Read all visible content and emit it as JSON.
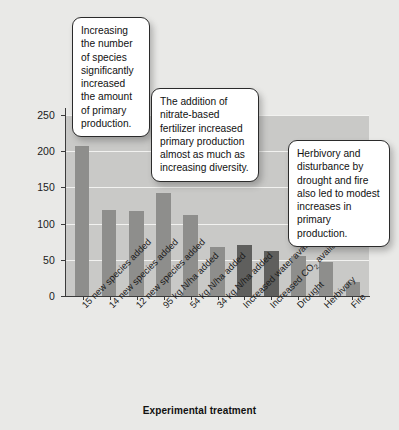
{
  "chart_data": {
    "type": "bar",
    "title": "",
    "xlabel": "Experimental treatment",
    "ylabel": "Biomass difference (g m⁻²)",
    "ylim": [
      0,
      250
    ],
    "yticks": [
      0,
      50,
      100,
      150,
      200,
      250
    ],
    "ytick_labels": [
      "0",
      "50",
      "100",
      "150",
      "200",
      "250"
    ],
    "grid": true,
    "legend": "none",
    "categories": [
      "15 new species added",
      "14 new species added",
      "12 new species added",
      "95 kg N/ha added",
      "54 kg N/ha added",
      "34 kg N/ha added",
      "Increased water availability",
      "Increased CO₂ availability",
      "Drought",
      "Herbivory",
      "Fire"
    ],
    "values": [
      207,
      119,
      117,
      142,
      112,
      68,
      70,
      62,
      55,
      47,
      20
    ],
    "bar_colors": [
      "#8e8e8c",
      "#8e8e8c",
      "#8e8e8c",
      "#8e8e8c",
      "#8e8e8c",
      "#8e8e8c",
      "#5f5f5d",
      "#5f5f5d",
      "#8e8e8c",
      "#8e8e8c",
      "#8e8e8c"
    ],
    "plot_background": "#c9c9c7",
    "figure_background": "#e9e9e7",
    "gridline_color": "#f2f2f0",
    "axis_color": "#3b3b3b",
    "annotations": [
      "Increasing the number of species significantly increased the amount of primary production.",
      "The addition of nitrate-based fertilizer increased primary production almost as much as increasing diversity.",
      "Herbivory and disturbance by drought and fire also led to modest increases in primary production."
    ]
  },
  "callouts": {
    "species": "Increasing the number of species significantly increased the amount of primary production.",
    "fertilizer": "The addition of nitrate-based fertilizer increased primary production almost as much as increasing diversity.",
    "disturbance": "Herbivory and disturbance by drought and fire also led to modest increases in primary production."
  }
}
